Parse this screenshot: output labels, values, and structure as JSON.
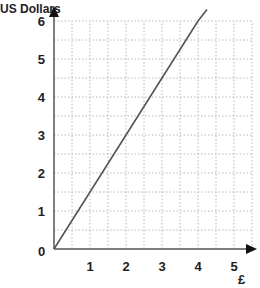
{
  "chart_data": {
    "type": "line",
    "title": "",
    "xlabel": "£",
    "ylabel": "US Dollars",
    "xlim": [
      0,
      5.5
    ],
    "ylim": [
      0,
      6.2
    ],
    "xticks": [
      "1",
      "2",
      "3",
      "4",
      "5"
    ],
    "yticks": [
      "0",
      "1",
      "2",
      "3",
      "4",
      "5",
      "6"
    ],
    "origin_label": "0",
    "grid": true,
    "grid_minor_step": 0.5,
    "series": [
      {
        "name": "Conversion",
        "x": [
          0,
          1,
          2,
          3,
          4,
          4.25
        ],
        "y": [
          0,
          1.5,
          3,
          4.5,
          6,
          6.3
        ]
      }
    ],
    "legend": "none"
  },
  "colors": {
    "axis": "#555555",
    "grid": "#b8b8b8",
    "line": "#555555",
    "text": "#222222"
  }
}
